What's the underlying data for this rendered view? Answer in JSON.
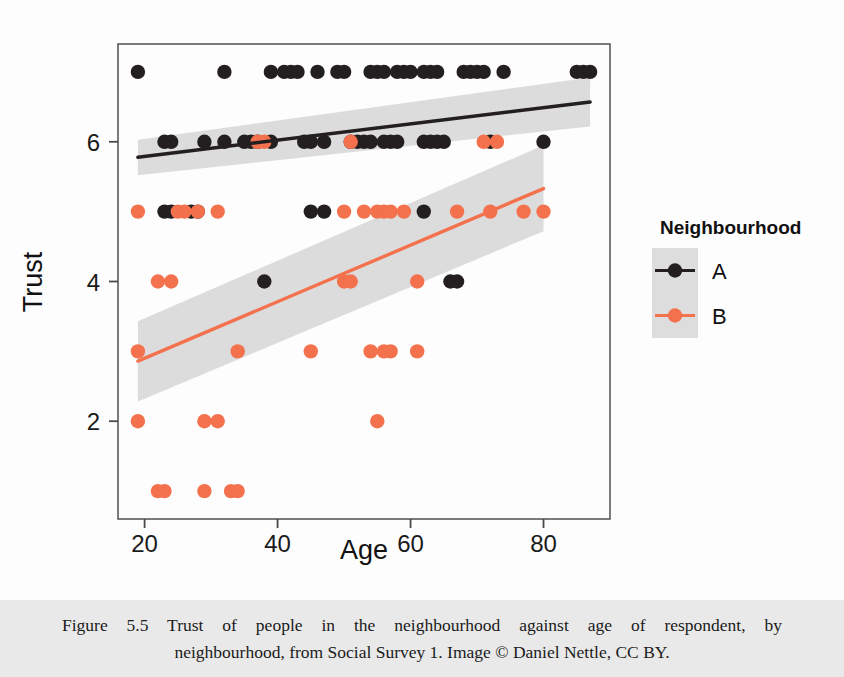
{
  "figure": {
    "caption_number": "Figure 5.5",
    "caption_line_1": "Figure 5.5   Trust of people in the neighbourhood against age of respondent, by",
    "caption_line_2": "neighbourhood, from Social Survey 1. Image © Daniel Nettle, CC BY."
  },
  "colors": {
    "series_a": "#231f20",
    "series_b": "#f4714d",
    "confidence_band": "#d9d9d9",
    "panel_border": "#5a5a5a",
    "caption_band": "#e9e9e9",
    "text": "#111111"
  },
  "legend": {
    "title": "Neighbourhood",
    "entries": [
      {
        "label": "A",
        "color": "#231f20"
      },
      {
        "label": "B",
        "color": "#f4714d"
      }
    ]
  },
  "chart_data": {
    "type": "scatter",
    "title": "",
    "xlabel": "Age",
    "ylabel": "Trust",
    "xlim": [
      16,
      90
    ],
    "ylim": [
      0.6,
      7.4
    ],
    "xticks": [
      20,
      40,
      60,
      80
    ],
    "yticks": [
      2,
      4,
      6
    ],
    "xtick_labels": [
      "20",
      "40",
      "60",
      "80"
    ],
    "ytick_labels": [
      "2",
      "4",
      "6"
    ],
    "grid": false,
    "legend_position": "right",
    "legend_title": "Neighbourhood",
    "series": [
      {
        "name": "A",
        "color": "#231f20",
        "points": [
          [
            19,
            7
          ],
          [
            32,
            7
          ],
          [
            39,
            7
          ],
          [
            41,
            7
          ],
          [
            42,
            7
          ],
          [
            43,
            7
          ],
          [
            46,
            7
          ],
          [
            49,
            7
          ],
          [
            50,
            7
          ],
          [
            54,
            7
          ],
          [
            55,
            7
          ],
          [
            56,
            7
          ],
          [
            58,
            7
          ],
          [
            59,
            7
          ],
          [
            60,
            7
          ],
          [
            62,
            7
          ],
          [
            63,
            7
          ],
          [
            64,
            7
          ],
          [
            68,
            7
          ],
          [
            69,
            7
          ],
          [
            70,
            7
          ],
          [
            71,
            7
          ],
          [
            74,
            7
          ],
          [
            85,
            7
          ],
          [
            86,
            7
          ],
          [
            87,
            7
          ],
          [
            23,
            6
          ],
          [
            24,
            6
          ],
          [
            29,
            6
          ],
          [
            32,
            6
          ],
          [
            35,
            6
          ],
          [
            36,
            6
          ],
          [
            37,
            6
          ],
          [
            39,
            6
          ],
          [
            44,
            6
          ],
          [
            45,
            6
          ],
          [
            47,
            6
          ],
          [
            51,
            6
          ],
          [
            52,
            6
          ],
          [
            53,
            6
          ],
          [
            54,
            6
          ],
          [
            56,
            6
          ],
          [
            57,
            6
          ],
          [
            58,
            6
          ],
          [
            62,
            6
          ],
          [
            63,
            6
          ],
          [
            64,
            6
          ],
          [
            65,
            6
          ],
          [
            72,
            6
          ],
          [
            80,
            6
          ],
          [
            23,
            5
          ],
          [
            24,
            5
          ],
          [
            27,
            5
          ],
          [
            28,
            5
          ],
          [
            45,
            5
          ],
          [
            47,
            5
          ],
          [
            62,
            5
          ],
          [
            38,
            4
          ],
          [
            66,
            4
          ],
          [
            67,
            4
          ]
        ],
        "trend": {
          "x_start": 19,
          "y_start": 5.78,
          "x_end": 87,
          "y_end": 6.57,
          "ci_upper_start": 6.03,
          "ci_lower_start": 5.52,
          "ci_upper_end": 6.92,
          "ci_lower_end": 6.22
        }
      },
      {
        "name": "B",
        "color": "#f4714d",
        "points": [
          [
            37,
            6
          ],
          [
            38,
            6
          ],
          [
            51,
            6
          ],
          [
            71,
            6
          ],
          [
            73,
            6
          ],
          [
            19,
            5
          ],
          [
            25,
            5
          ],
          [
            26,
            5
          ],
          [
            28,
            5
          ],
          [
            31,
            5
          ],
          [
            50,
            5
          ],
          [
            53,
            5
          ],
          [
            55,
            5
          ],
          [
            56,
            5
          ],
          [
            57,
            5
          ],
          [
            59,
            5
          ],
          [
            67,
            5
          ],
          [
            72,
            5
          ],
          [
            77,
            5
          ],
          [
            80,
            5
          ],
          [
            22,
            4
          ],
          [
            24,
            4
          ],
          [
            50,
            4
          ],
          [
            51,
            4
          ],
          [
            61,
            4
          ],
          [
            19,
            3
          ],
          [
            34,
            3
          ],
          [
            45,
            3
          ],
          [
            54,
            3
          ],
          [
            56,
            3
          ],
          [
            57,
            3
          ],
          [
            61,
            3
          ],
          [
            19,
            2
          ],
          [
            29,
            2
          ],
          [
            31,
            2
          ],
          [
            55,
            2
          ],
          [
            22,
            1
          ],
          [
            23,
            1
          ],
          [
            29,
            1
          ],
          [
            33,
            1
          ],
          [
            34,
            1
          ]
        ],
        "trend": {
          "x_start": 19,
          "y_start": 2.86,
          "x_end": 80,
          "y_end": 5.33,
          "ci_upper_start": 3.43,
          "ci_lower_start": 2.28,
          "ci_upper_end": 5.95,
          "ci_lower_end": 4.72
        }
      }
    ]
  }
}
